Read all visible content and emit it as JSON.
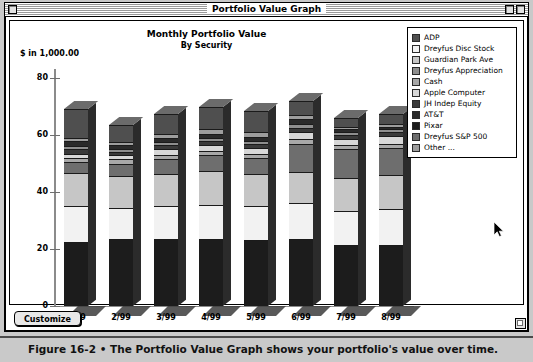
{
  "window": {
    "title": "Portfolio Value Graph",
    "close_box": "close-box",
    "zoom_box": "zoom-box",
    "collapse_box": "collapse-box",
    "grow_box": "grow-box"
  },
  "toolbar": {
    "customize_label": "Customize"
  },
  "figure": {
    "caption": "Figure 16-2 • The Portfolio Value Graph shows your portfolio's value over time."
  },
  "cursor": {
    "name": "arrow-pointer",
    "x": 488,
    "y": 218
  },
  "legend": {
    "position": "top-right",
    "items": [
      {
        "label": "ADP",
        "color": "#4f4f4f"
      },
      {
        "label": "Dreyfus Disc Stock",
        "color": "#f2f2f2"
      },
      {
        "label": "Guardian Park Ave",
        "color": "#c6c6c6"
      },
      {
        "label": "Dreyfus Appreciation",
        "color": "#8e8e8e"
      },
      {
        "label": "Cash",
        "color": "#a8a8a8"
      },
      {
        "label": "Apple Computer",
        "color": "#d8d8d8"
      },
      {
        "label": "JH Indep Equity",
        "color": "#3a3a3a"
      },
      {
        "label": "AT&T",
        "color": "#2a2a2a"
      },
      {
        "label": "Pixar",
        "color": "#1c1c1c"
      },
      {
        "label": "Dreyfus S&P 500",
        "color": "#6e6e6e"
      },
      {
        "label": "Other ...",
        "color": "#9d9d9d"
      }
    ]
  },
  "chart_data": {
    "type": "bar",
    "subtype": "stacked-3d-column",
    "title": "Monthly Portfolio Value",
    "subtitle": "By Security",
    "xlabel": "",
    "ylabel": "$ in 1,000.00",
    "ylim": [
      0,
      80
    ],
    "yticks": [
      0,
      20,
      40,
      60,
      80
    ],
    "grid": false,
    "legend_position": "top-right",
    "categories": [
      "1/99",
      "2/99",
      "3/99",
      "4/99",
      "5/99",
      "6/99",
      "7/99",
      "8/99"
    ],
    "totals": [
      69.0,
      63.5,
      67.5,
      70.0,
      68.5,
      72.0,
      66.0,
      67.5
    ],
    "series": [
      {
        "name": "Pixar",
        "color": "#1c1c1c",
        "values": [
          22.5,
          23.5,
          23.5,
          23.5,
          23.0,
          23.5,
          21.5,
          21.5
        ]
      },
      {
        "name": "Dreyfus Disc Stock",
        "color": "#f2f2f2",
        "values": [
          12.5,
          11.0,
          11.5,
          12.0,
          12.0,
          12.5,
          12.0,
          12.5
        ]
      },
      {
        "name": "Guardian Park Ave",
        "color": "#c6c6c6",
        "values": [
          11.5,
          11.0,
          11.5,
          12.0,
          11.5,
          11.0,
          11.5,
          12.0
        ]
      },
      {
        "name": "Dreyfus S&P 500",
        "color": "#6e6e6e",
        "values": [
          4.0,
          4.5,
          5.0,
          5.5,
          5.5,
          10.0,
          10.0,
          9.5
        ]
      },
      {
        "name": "Cash",
        "color": "#a8a8a8",
        "values": [
          1.5,
          1.5,
          1.5,
          1.5,
          1.5,
          1.5,
          1.5,
          1.5
        ]
      },
      {
        "name": "Apple Computer",
        "color": "#d8d8d8",
        "values": [
          1.5,
          1.5,
          2.0,
          2.0,
          2.0,
          2.5,
          2.0,
          2.5
        ]
      },
      {
        "name": "JH Indep Equity",
        "color": "#3a3a3a",
        "values": [
          1.5,
          1.0,
          1.5,
          1.5,
          1.5,
          1.5,
          1.5,
          1.5
        ]
      },
      {
        "name": "Dreyfus Appreciation",
        "color": "#8e8e8e",
        "values": [
          1.0,
          1.0,
          1.0,
          1.0,
          1.0,
          1.5,
          1.0,
          1.0
        ]
      },
      {
        "name": "AT&T",
        "color": "#2a2a2a",
        "values": [
          2.0,
          1.5,
          1.5,
          1.5,
          1.5,
          1.5,
          1.0,
          1.0
        ]
      },
      {
        "name": "Other ...",
        "color": "#9d9d9d",
        "values": [
          1.0,
          1.0,
          1.5,
          1.5,
          1.5,
          1.5,
          1.0,
          1.0
        ]
      },
      {
        "name": "ADP",
        "color": "#4f4f4f",
        "values": [
          10.0,
          6.0,
          7.0,
          8.0,
          7.5,
          5.0,
          3.0,
          3.5
        ]
      }
    ]
  }
}
